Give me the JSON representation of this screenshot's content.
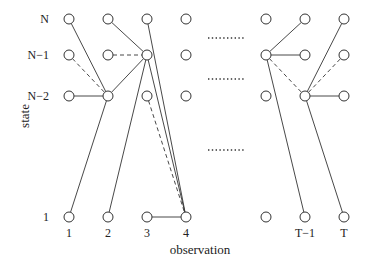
{
  "diagram": {
    "axis_labels": {
      "x": "observation",
      "y": "state"
    },
    "column_labels": [
      "1",
      "2",
      "3",
      "4",
      "",
      "T−1",
      "T"
    ],
    "row_labels": [
      "N",
      "N−1",
      "N−2",
      "1"
    ],
    "columns_x": [
      69,
      108,
      147,
      186,
      266,
      305,
      344
    ],
    "rows_y": [
      19,
      55,
      96,
      217
    ],
    "ellipsis_rows_y": [
      38,
      79,
      150
    ],
    "edges": [
      {
        "from": [
          0,
          0
        ],
        "to": [
          1,
          2
        ],
        "style": "solid"
      },
      {
        "from": [
          0,
          1
        ],
        "to": [
          1,
          2
        ],
        "style": "dashed"
      },
      {
        "from": [
          0,
          2
        ],
        "to": [
          1,
          2
        ],
        "style": "solid"
      },
      {
        "from": [
          0,
          3
        ],
        "to": [
          1,
          2
        ],
        "style": "solid"
      },
      {
        "from": [
          1,
          0
        ],
        "to": [
          2,
          1
        ],
        "style": "solid"
      },
      {
        "from": [
          1,
          1
        ],
        "to": [
          2,
          1
        ],
        "style": "dashed"
      },
      {
        "from": [
          1,
          2
        ],
        "to": [
          2,
          1
        ],
        "style": "solid"
      },
      {
        "from": [
          1,
          3
        ],
        "to": [
          2,
          1
        ],
        "style": "solid"
      },
      {
        "from": [
          2,
          0
        ],
        "to": [
          3,
          3
        ],
        "style": "solid"
      },
      {
        "from": [
          2,
          1
        ],
        "to": [
          3,
          3
        ],
        "style": "solid"
      },
      {
        "from": [
          2,
          2
        ],
        "to": [
          3,
          3
        ],
        "style": "dashed"
      },
      {
        "from": [
          2,
          3
        ],
        "to": [
          3,
          3
        ],
        "style": "solid"
      },
      {
        "from": [
          4,
          1
        ],
        "to": [
          5,
          0
        ],
        "style": "solid"
      },
      {
        "from": [
          4,
          1
        ],
        "to": [
          5,
          1
        ],
        "style": "solid"
      },
      {
        "from": [
          4,
          1
        ],
        "to": [
          5,
          2
        ],
        "style": "dashed"
      },
      {
        "from": [
          4,
          1
        ],
        "to": [
          5,
          3
        ],
        "style": "solid"
      },
      {
        "from": [
          5,
          2
        ],
        "to": [
          6,
          0
        ],
        "style": "solid"
      },
      {
        "from": [
          5,
          2
        ],
        "to": [
          6,
          1
        ],
        "style": "dashed"
      },
      {
        "from": [
          5,
          2
        ],
        "to": [
          6,
          2
        ],
        "style": "solid"
      },
      {
        "from": [
          5,
          2
        ],
        "to": [
          6,
          3
        ],
        "style": "solid"
      }
    ],
    "colors": {
      "line": "#333333",
      "background": "#ffffff"
    }
  }
}
